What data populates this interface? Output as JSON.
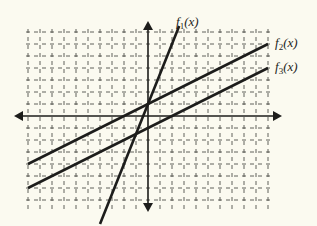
{
  "chart_data": {
    "type": "line",
    "title": "",
    "xlabel": "",
    "ylabel": "",
    "grid": true,
    "xlim": [
      -10,
      10
    ],
    "ylim": [
      -7.5,
      7.5
    ],
    "series": [
      {
        "name": "f1(x)",
        "label_base": "f",
        "label_sub": "1",
        "label_tail": "(x)",
        "slope": 2.5,
        "intercept": 1,
        "x": [
          -4,
          2.6
        ],
        "y": [
          -9,
          7.5
        ]
      },
      {
        "name": "f2(x)",
        "label_base": "f",
        "label_sub": "2",
        "label_tail": "(x)",
        "slope": 0.5,
        "intercept": 1,
        "x": [
          -10,
          10
        ],
        "y": [
          -4,
          6
        ]
      },
      {
        "name": "f3(x)",
        "label_base": "f",
        "label_sub": "3",
        "label_tail": "(x)",
        "slope": 0.5,
        "intercept": -1,
        "x": [
          -10,
          10
        ],
        "y": [
          -6,
          4
        ]
      }
    ],
    "annotations": [
      "f1(x) and f2(x) intersect at (0, 1)",
      "f2(x) and f3(x) are parallel"
    ]
  },
  "colors": {
    "background": "#fbfaf0",
    "line": "#1d1d1b",
    "grid": "#3a3a36"
  }
}
